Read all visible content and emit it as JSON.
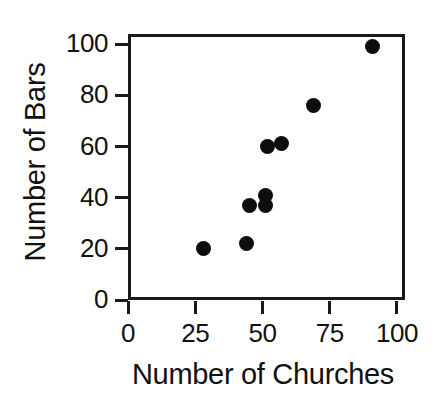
{
  "chart_data": {
    "type": "scatter",
    "title": "",
    "xlabel": "Number of Churches",
    "ylabel": "Number of Bars",
    "xlim": [
      0,
      103
    ],
    "ylim": [
      0,
      104
    ],
    "xticks": [
      0,
      25,
      50,
      75,
      100
    ],
    "yticks": [
      0,
      20,
      40,
      60,
      80,
      100
    ],
    "xticklabels": [
      "0",
      "25",
      "50",
      "75",
      "100"
    ],
    "yticklabels": [
      "0",
      "20",
      "40",
      "60",
      "80",
      "100"
    ],
    "grid": false,
    "legend": false,
    "marker": "filled-circle",
    "marker_color": "#0d0d0d",
    "marker_size": 15,
    "frame_color": "#1a1a1a",
    "background_color": "#ffffff",
    "points": [
      {
        "x": 28,
        "y": 20
      },
      {
        "x": 44,
        "y": 22
      },
      {
        "x": 45,
        "y": 37
      },
      {
        "x": 51,
        "y": 37
      },
      {
        "x": 51,
        "y": 41
      },
      {
        "x": 52,
        "y": 60
      },
      {
        "x": 57,
        "y": 61
      },
      {
        "x": 69,
        "y": 76
      },
      {
        "x": 91,
        "y": 99
      }
    ]
  }
}
